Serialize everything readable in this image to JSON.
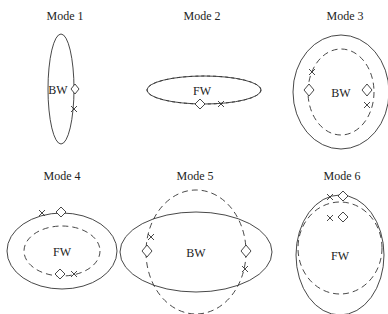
{
  "diagram": {
    "panels": [
      {
        "title": "Mode 1",
        "label": "BW"
      },
      {
        "title": "Mode 2",
        "label": "FW"
      },
      {
        "title": "Mode 3",
        "label": "BW"
      },
      {
        "title": "Mode 4",
        "label": "FW"
      },
      {
        "title": "Mode 5",
        "label": "BW"
      },
      {
        "title": "Mode 6",
        "label": "FW"
      }
    ],
    "legend_markers": {
      "diamond": "diamond-marker",
      "cross": "x-marker"
    }
  }
}
